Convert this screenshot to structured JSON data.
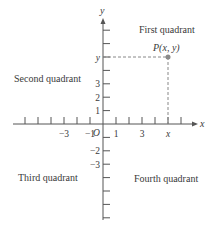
{
  "diagram": {
    "type": "coordinate-plane",
    "axes": {
      "x_label": "x",
      "y_label": "y",
      "origin_label": "O"
    },
    "x_ticks": {
      "negative_count": 6,
      "positive_count": 6,
      "labels": [
        {
          "value": -3,
          "text": "−3"
        },
        {
          "value": -1,
          "text": "−1"
        },
        {
          "value": 1,
          "text": "1"
        },
        {
          "value": 3,
          "text": "3"
        },
        {
          "value": 5,
          "text": "x"
        }
      ]
    },
    "y_ticks": {
      "positive_count": 7,
      "negative_count": 7,
      "labels": [
        {
          "value": 1,
          "text": "1"
        },
        {
          "value": 2,
          "text": "2"
        },
        {
          "value": 3,
          "text": "3"
        },
        {
          "value": 5,
          "text": "y"
        },
        {
          "value": -2,
          "text": "−2"
        },
        {
          "value": -3,
          "text": "−3"
        }
      ]
    },
    "point": {
      "label": "P(x, y)",
      "x": 5,
      "y": 5,
      "color": "#8a8a8a"
    },
    "quadrants": {
      "first": "First quadrant",
      "second": "Second quadrant",
      "third": "Third quadrant",
      "fourth": "Fourth quadrant"
    }
  }
}
